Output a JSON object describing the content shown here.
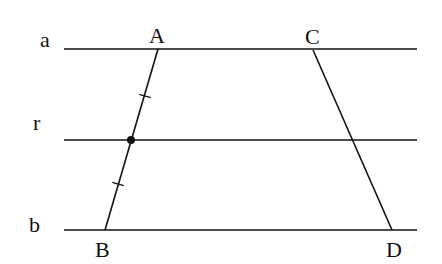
{
  "diagram": {
    "lines": [
      {
        "name": "a",
        "label": "a",
        "y": 49,
        "x1": 64,
        "x2": 417,
        "label_x": 40,
        "label_y": 47
      },
      {
        "name": "r",
        "label": "r",
        "y": 140,
        "x1": 64,
        "x2": 417,
        "label_x": 33,
        "label_y": 130
      },
      {
        "name": "b",
        "label": "b",
        "y": 230,
        "x1": 64,
        "x2": 417,
        "label_x": 29,
        "label_y": 232
      }
    ],
    "points": {
      "A": {
        "label": "A",
        "x": 158,
        "y": 49,
        "label_x": 149,
        "label_y": 43
      },
      "B": {
        "label": "B",
        "x": 105,
        "y": 230,
        "label_x": 95,
        "label_y": 257
      },
      "C": {
        "label": "C",
        "x": 313,
        "y": 50,
        "label_x": 305,
        "label_y": 44
      },
      "D": {
        "label": "D",
        "x": 392,
        "y": 230,
        "label_x": 386,
        "label_y": 257
      },
      "M": {
        "label": "",
        "x": 131,
        "y": 140
      }
    },
    "segments": [
      {
        "name": "AB",
        "from": "A",
        "to": "B"
      },
      {
        "name": "CD",
        "from": "C",
        "to": "D"
      }
    ],
    "tick_marks": [
      {
        "segment": "AB",
        "x": 145,
        "y": 96
      },
      {
        "segment": "AB",
        "x": 118,
        "y": 184
      }
    ],
    "colors": {
      "stroke": "#111111",
      "background": "#ffffff"
    }
  }
}
